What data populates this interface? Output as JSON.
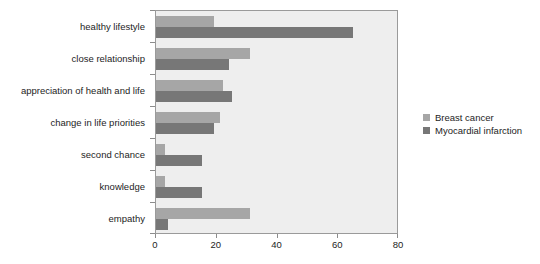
{
  "chart_data": {
    "type": "bar",
    "orientation": "horizontal",
    "title": "",
    "subtitle": "",
    "xlabel": "",
    "ylabel": "",
    "xlim": [
      0,
      80
    ],
    "xticks": [
      0,
      20,
      40,
      60,
      80
    ],
    "grid": false,
    "legend_position": "right",
    "categories": [
      "healthy lifestyle",
      "close relationship",
      "appreciation of health and life",
      "change in life priorities",
      "second chance",
      "knowledge",
      "empathy"
    ],
    "series": [
      {
        "name": "Breast cancer",
        "color": "#a6a6a6",
        "values": [
          19,
          31,
          22,
          21,
          3,
          3,
          31
        ]
      },
      {
        "name": "Myocardial infarction",
        "color": "#777777",
        "values": [
          65,
          24,
          25,
          19,
          15,
          15,
          4
        ]
      }
    ]
  },
  "legend": {
    "entries": [
      {
        "label": "Breast cancer"
      },
      {
        "label": "Myocardial infarction"
      }
    ]
  },
  "axis": {
    "x_tick_labels": [
      "0",
      "20",
      "40",
      "60",
      "80"
    ]
  },
  "colors": {
    "series_breast_cancer": "#a6a6a6",
    "series_myocardial_infarction": "#777777",
    "plot_background": "#eeeeee",
    "plot_border": "#9a9a9a",
    "text": "#1d1d1d"
  }
}
